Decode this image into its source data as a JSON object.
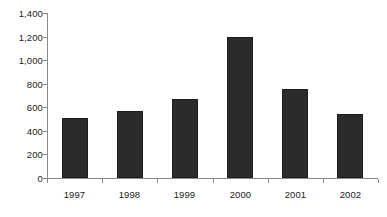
{
  "chart_data": {
    "type": "bar",
    "title": "",
    "subtitle": "",
    "xlabel": "",
    "ylabel": "",
    "categories": [
      "1997",
      "1998",
      "1999",
      "2000",
      "2001",
      "2002"
    ],
    "values": [
      510,
      570,
      670,
      1195,
      755,
      545
    ],
    "ylim": [
      0,
      1400
    ],
    "y_ticks": [
      0,
      200,
      400,
      600,
      800,
      1000,
      1200,
      1400
    ],
    "y_tick_labels": [
      "0",
      "200",
      "400",
      "600",
      "800",
      "1,000",
      "1,200",
      "1,400"
    ],
    "grid": false,
    "legend": false,
    "legend_position": "none",
    "annotations": [],
    "colors": {
      "bar_fill": "#2b2b2b",
      "bar_border": "#1e1e1e",
      "axis": "#8a8a8a",
      "text": "#1a1a1a",
      "background": "#ffffff"
    }
  }
}
